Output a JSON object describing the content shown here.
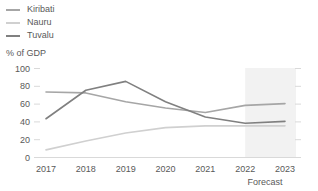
{
  "chart_data": {
    "type": "line",
    "title": "",
    "subtitle": "",
    "ylabel": "% of GDP",
    "xlabel": "",
    "categories": [
      "2017",
      "2018",
      "2019",
      "2020",
      "2021",
      "2022",
      "2023"
    ],
    "ylim": [
      0,
      100
    ],
    "yticks": [
      0,
      20,
      40,
      60,
      80,
      100
    ],
    "grid": false,
    "legend_position": "top-left",
    "annotations": [
      {
        "name": "forecast",
        "text": "Forecast",
        "start_category": "2022",
        "end_category": "2023"
      }
    ],
    "series": [
      {
        "name": "Kiribati",
        "color": "#a6a6a6",
        "values": [
          73,
          72,
          62,
          55,
          50,
          58,
          60
        ]
      },
      {
        "name": "Nauru",
        "color": "#d0d0d0",
        "values": [
          8,
          18,
          27,
          33,
          35,
          35,
          35
        ]
      },
      {
        "name": "Tuvalu",
        "color": "#808080",
        "values": [
          43,
          75,
          85,
          62,
          45,
          38,
          40
        ]
      }
    ]
  },
  "legend": {
    "items": [
      {
        "label": "Kiribati",
        "color": "#a6a6a6"
      },
      {
        "label": "Nauru",
        "color": "#d0d0d0"
      },
      {
        "label": "Tuvalu",
        "color": "#808080"
      }
    ]
  },
  "axis": {
    "y_title": "% of GDP",
    "y_labels": [
      "100",
      "80",
      "60",
      "40",
      "20",
      "0"
    ],
    "x_labels": [
      "2017",
      "2018",
      "2019",
      "2020",
      "2021",
      "2022",
      "2023"
    ],
    "forecast_label": "Forecast"
  },
  "colors": {
    "kiribati": "#a6a6a6",
    "nauru": "#d0d0d0",
    "tuvalu": "#808080",
    "axis": "#d9d9d9",
    "text": "#595959",
    "forecast_band": "#ededed"
  }
}
